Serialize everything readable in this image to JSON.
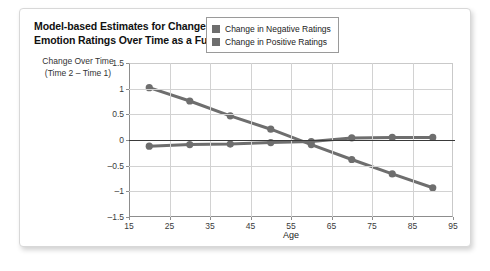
{
  "figure": {
    "title": "Model-based Estimates for Change in Positive and Negative Emotion Ratings Over Time as a Function of Age",
    "title_line1": "Model-based Estimates for Change in Positive and Negative",
    "title_line2": "Emotion Ratings Over Time as a Function of Age",
    "y_axis_label_line1": "Change Over Time",
    "y_axis_label_line2": "(Time 2 – Time 1)"
  },
  "colors": {
    "series": "#6e6e6e",
    "grid": "#d2d2d2",
    "axis": "#8d8d8d",
    "zero_line": "#3a3a3a",
    "card_border": "#d8d8d8",
    "text": "#222222"
  },
  "chart_data": {
    "type": "line",
    "title": "Model-based Estimates for Change in Positive and Negative Emotion Ratings Over Time as a Function of Age",
    "xlabel": "Age",
    "ylabel": "Change Over Time (Time 2 – Time 1)",
    "x": [
      20,
      30,
      40,
      50,
      60,
      70,
      80,
      90
    ],
    "xlim": [
      15,
      95
    ],
    "ylim": [
      -1.5,
      1.5
    ],
    "xticks": [
      15,
      25,
      35,
      45,
      55,
      65,
      75,
      85,
      95
    ],
    "yticks": [
      1.5,
      1,
      0.5,
      0,
      -0.5,
      -1,
      -1.5
    ],
    "ytick_labels": [
      "1.5",
      "1",
      "0.5",
      "0",
      "–0.5",
      "–1",
      "–1.5"
    ],
    "xtick_labels": [
      "15",
      "25",
      "35",
      "45",
      "55",
      "65",
      "75",
      "85",
      "95"
    ],
    "grid": true,
    "legend_position": "top-right",
    "series": [
      {
        "name": "Change in Negative Ratings",
        "color": "#6e6e6e",
        "marker": "circle",
        "values": [
          1.02,
          0.76,
          0.47,
          0.21,
          -0.09,
          -0.38,
          -0.66,
          -0.93
        ]
      },
      {
        "name": "Change in Positive Ratings",
        "color": "#6e6e6e",
        "marker": "circle",
        "values": [
          -0.12,
          -0.09,
          -0.08,
          -0.05,
          -0.03,
          0.04,
          0.05,
          0.05
        ]
      }
    ]
  }
}
